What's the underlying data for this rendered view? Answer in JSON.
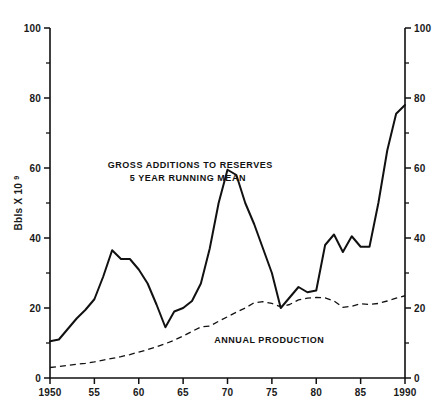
{
  "chart_data": {
    "type": "line",
    "title": "",
    "xlabel": "",
    "ylabel": "Bbls X 10⁹",
    "ylabel_base": "Bbls X 10",
    "ylabel_exponent": "9",
    "xlim": [
      1950,
      1990
    ],
    "ylim": [
      0,
      100
    ],
    "grid": false,
    "legend_position": "inline-annotation",
    "left_axis_ticks": [
      "0",
      "20",
      "40",
      "60",
      "80",
      "100"
    ],
    "left_axis_tick_values": [
      0,
      20,
      40,
      60,
      80,
      100
    ],
    "right_axis_ticks": [
      "0",
      "20",
      "40",
      "60",
      "80",
      "100"
    ],
    "right_axis_tick_values": [
      0,
      20,
      40,
      60,
      80,
      100
    ],
    "y_minor_tick_values": [
      10,
      30,
      50,
      70,
      90
    ],
    "x_tick_labels": [
      "1950",
      "55",
      "60",
      "65",
      "70",
      "75",
      "80",
      "85",
      "1990"
    ],
    "x_tick_values": [
      1950,
      1955,
      1960,
      1965,
      1970,
      1975,
      1980,
      1985,
      1990
    ],
    "annotations": [
      {
        "name": "gross-additions-label",
        "lines": [
          "GROSS ADDITIONS TO RESERVES",
          "5 YEAR RUNNING MEAN"
        ],
        "line1": "GROSS ADDITIONS TO RESERVES",
        "line2": "5 YEAR RUNNING MEAN",
        "x": 1956.5,
        "y": 60,
        "anchor": "start"
      },
      {
        "name": "annual-production-label",
        "lines": [
          "ANNUAL PRODUCTION"
        ],
        "line1": "ANNUAL PRODUCTION",
        "x": 1968.5,
        "y": 10,
        "anchor": "start"
      }
    ],
    "series": [
      {
        "name": "Gross Additions to Reserves (5 Year Running Mean)",
        "short_name": "gross-additions-to-reserves",
        "style": "solid",
        "color": "#111111",
        "x": [
          1950,
          1951,
          1952,
          1953,
          1954,
          1955,
          1956,
          1957,
          1958,
          1959,
          1960,
          1961,
          1962,
          1963,
          1964,
          1965,
          1966,
          1967,
          1968,
          1969,
          1970,
          1971,
          1972,
          1973,
          1974,
          1975,
          1976,
          1977,
          1978,
          1979,
          1980,
          1981,
          1982,
          1983,
          1984,
          1985,
          1986,
          1987,
          1988,
          1989,
          1990
        ],
        "values": [
          10.5,
          11.0,
          14.0,
          17.0,
          19.5,
          22.5,
          29.0,
          36.5,
          34.0,
          34.0,
          31.0,
          27.0,
          21.0,
          14.5,
          19.0,
          20.0,
          22.0,
          27.0,
          37.0,
          50.0,
          59.5,
          58.0,
          50.0,
          44.0,
          37.0,
          30.0,
          20.0,
          23.0,
          26.0,
          24.5,
          25.0,
          38.0,
          41.0,
          36.0,
          40.5,
          37.5,
          37.5,
          50.0,
          65.0,
          75.5,
          78.0
        ]
      },
      {
        "name": "Annual Production",
        "short_name": "annual-production",
        "style": "dashed",
        "color": "#111111",
        "x": [
          1950,
          1951,
          1952,
          1953,
          1954,
          1955,
          1956,
          1957,
          1958,
          1959,
          1960,
          1961,
          1962,
          1963,
          1964,
          1965,
          1966,
          1967,
          1968,
          1969,
          1970,
          1971,
          1972,
          1973,
          1974,
          1975,
          1976,
          1977,
          1978,
          1979,
          1980,
          1981,
          1982,
          1983,
          1984,
          1985,
          1986,
          1987,
          1988,
          1989,
          1990
        ],
        "values": [
          3.0,
          3.3,
          3.6,
          3.9,
          4.2,
          4.6,
          5.1,
          5.6,
          6.1,
          6.7,
          7.4,
          8.1,
          8.9,
          9.8,
          10.8,
          12.0,
          13.3,
          14.6,
          14.8,
          16.2,
          17.5,
          18.8,
          20.0,
          21.5,
          21.8,
          21.3,
          20.3,
          21.0,
          22.3,
          22.8,
          23.0,
          22.9,
          22.0,
          20.2,
          20.5,
          21.2,
          21.0,
          21.3,
          22.0,
          22.8,
          23.5
        ]
      }
    ]
  }
}
